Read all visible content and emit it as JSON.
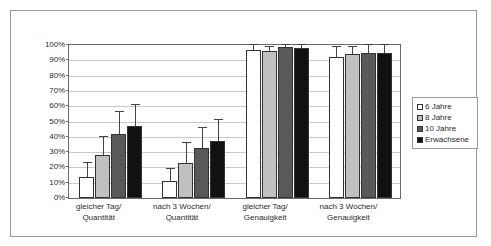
{
  "chart_data": {
    "type": "bar",
    "title": "",
    "subtitle": "",
    "xlabel": "",
    "ylabel": "",
    "ylim": [
      0,
      100
    ],
    "grid": true,
    "legend_position": "right",
    "y_ticks": [
      "0%",
      "10%",
      "20%",
      "30%",
      "40%",
      "50%",
      "60%",
      "70%",
      "80%",
      "90%",
      "100%"
    ],
    "y_tick_values": [
      0,
      10,
      20,
      30,
      40,
      50,
      60,
      70,
      80,
      90,
      100
    ],
    "categories": [
      "gleicher Tag/\nQuantität",
      "nach 3 Wochen/\nQuantität",
      "gleicher Tag/\nGenauigkeit",
      "nach 3 Wochen/\nGenauigkeit"
    ],
    "category_lines": [
      [
        "gleicher Tag/",
        "Quantität"
      ],
      [
        "nach 3 Wochen/",
        "Quantität"
      ],
      [
        "gleicher Tag/",
        "Genauigkeit"
      ],
      [
        "nach 3 Wochen/",
        "Genauigkeit"
      ]
    ],
    "series": [
      {
        "name": "6 Jahre",
        "color": "#ffffff",
        "values": [
          14,
          11,
          97,
          92
        ],
        "errors_upper": [
          9,
          8,
          3,
          7
        ],
        "errors_lower": [
          0,
          0,
          0,
          0
        ]
      },
      {
        "name": "8 Jahre",
        "color": "#c0c0c0",
        "values": [
          28,
          23,
          96,
          94
        ],
        "errors_upper": [
          12,
          13,
          3,
          5
        ],
        "errors_lower": [
          0,
          0,
          0,
          0
        ]
      },
      {
        "name": "10 Jahre",
        "color": "#595959",
        "values": [
          42,
          33,
          99,
          95
        ],
        "errors_upper": [
          14,
          13,
          1,
          5
        ],
        "errors_lower": [
          0,
          0,
          0,
          0
        ]
      },
      {
        "name": "Erwachsene",
        "color": "#111111",
        "values": [
          47,
          37,
          98,
          95
        ],
        "errors_upper": [
          14,
          14,
          2,
          5
        ],
        "errors_lower": [
          0,
          0,
          0,
          0
        ]
      }
    ]
  },
  "legend": {
    "items": [
      {
        "label": "6 Jahre",
        "color": "#ffffff"
      },
      {
        "label": "8 Jahre",
        "color": "#c0c0c0"
      },
      {
        "label": "10 Jahre",
        "color": "#595959"
      },
      {
        "label": "Erwachsene",
        "color": "#111111"
      }
    ]
  }
}
